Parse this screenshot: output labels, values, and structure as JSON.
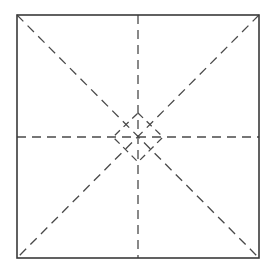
{
  "diagram": {
    "type": "crease-pattern",
    "colors": {
      "background": "#ffffff",
      "outline": "#3a3a3a",
      "dashed": "#4a4a4a"
    },
    "square": {
      "x1": 17,
      "y1": 15,
      "x2": 259,
      "y2": 258
    },
    "center": {
      "x": 138,
      "y": 137
    },
    "diamond": {
      "top": [
        138,
        113
      ],
      "right": [
        163,
        137
      ],
      "bottom": [
        138,
        162
      ],
      "left": [
        113,
        137
      ]
    },
    "dash_pattern": "9 6"
  }
}
